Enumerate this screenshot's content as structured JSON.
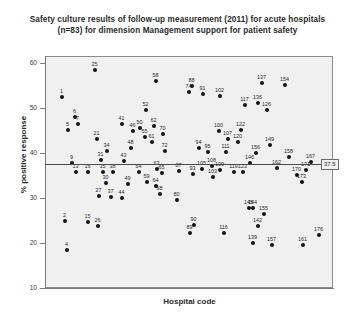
{
  "chart_title": {
    "line1": "Safety culture results of follow-up measurement (2011) for acute hospitals",
    "line2": "(n=83) for dimension Management support for patient safety"
  },
  "axes": {
    "y_label": "% positive response",
    "x_label": "Hospital code",
    "y_ticks": [
      "10",
      "20",
      "30",
      "40",
      "50",
      "60"
    ],
    "y_min": 10,
    "y_max": 62,
    "x_min": 0,
    "x_max": 185
  },
  "reference": {
    "value": 37.5,
    "label": "37.5"
  },
  "colors": {
    "plot_background": "#f0f0f0",
    "point": "#141414",
    "frame": "#8c8c8c",
    "reference_line": "#4a4a4a",
    "text": "#2a2a2a"
  },
  "chart_data": {
    "type": "scatter",
    "title": "Safety culture results of follow-up measurement (2011) for acute hospitals (n=83) for dimension Management support for patient safety",
    "xlabel": "Hospital code",
    "ylabel": "% positive response",
    "ylim": [
      10,
      62
    ],
    "xlim": [
      0,
      185
    ],
    "grid": false,
    "legend": null,
    "annotations": [
      {
        "text": "37.5",
        "type": "reference-line-value",
        "y": 37.5
      }
    ],
    "point_label_field": "Hospital code",
    "points": [
      {
        "label": "1",
        "px": 62,
        "py": 97,
        "y": 51.9
      },
      {
        "label": "2",
        "px": 65,
        "py": 221,
        "y": 20.0
      },
      {
        "label": "4",
        "px": 67,
        "py": 250,
        "y": 18.2
      },
      {
        "label": "5",
        "px": 68,
        "py": 130,
        "y": 47.4
      },
      {
        "label": "6",
        "px": 75,
        "py": 117,
        "y": 48.7
      },
      {
        "label": "7",
        "px": 78,
        "py": 124,
        "y": 47.9
      },
      {
        "label": "9",
        "px": 72,
        "py": 163,
        "y": 37.5
      },
      {
        "label": "13",
        "px": 76,
        "py": 172,
        "y": 36.0
      },
      {
        "label": "15",
        "px": 88,
        "py": 222,
        "y": 19.9
      },
      {
        "label": "16",
        "px": 88,
        "py": 172,
        "y": 36.0
      },
      {
        "label": "25",
        "px": 95,
        "py": 70,
        "y": 58.0
      },
      {
        "label": "26",
        "px": 98,
        "py": 226,
        "y": 19.5
      },
      {
        "label": "21",
        "px": 97,
        "py": 139,
        "y": 44.8
      },
      {
        "label": "27",
        "px": 99,
        "py": 196,
        "y": 25.5
      },
      {
        "label": "30",
        "px": 106,
        "py": 183,
        "y": 29.0
      },
      {
        "label": "31",
        "px": 101,
        "py": 160,
        "y": 38.5
      },
      {
        "label": "34",
        "px": 107,
        "py": 151,
        "y": 41.0
      },
      {
        "label": "35",
        "px": 103,
        "py": 172,
        "y": 36.0
      },
      {
        "label": "37",
        "px": 111,
        "py": 197,
        "y": 25.2
      },
      {
        "label": "38",
        "px": 113,
        "py": 172,
        "y": 36.0
      },
      {
        "label": "41",
        "px": 122,
        "py": 124,
        "y": 47.9
      },
      {
        "label": "43",
        "px": 124,
        "py": 161,
        "y": 38.2
      },
      {
        "label": "44",
        "px": 122,
        "py": 198,
        "y": 25.0
      },
      {
        "label": "46",
        "px": 133,
        "py": 131,
        "y": 47.2
      },
      {
        "label": "48",
        "px": 131,
        "py": 148,
        "y": 41.8
      },
      {
        "label": "49",
        "px": 128,
        "py": 184,
        "y": 28.7
      },
      {
        "label": "50",
        "px": 140,
        "py": 128,
        "y": 48.0
      },
      {
        "label": "52",
        "px": 146,
        "py": 110,
        "y": 50.5
      },
      {
        "label": "54",
        "px": 139,
        "py": 172,
        "y": 36.0
      },
      {
        "label": "55",
        "px": 145,
        "py": 137,
        "y": 45.2
      },
      {
        "label": "58",
        "px": 156,
        "py": 81,
        "y": 55.8
      },
      {
        "label": "59",
        "px": 147,
        "py": 182,
        "y": 29.2
      },
      {
        "label": "61",
        "px": 152,
        "py": 142,
        "y": 43.8
      },
      {
        "label": "62",
        "px": 154,
        "py": 126,
        "y": 48.3
      },
      {
        "label": "63",
        "px": 157,
        "py": 169,
        "y": 36.8
      },
      {
        "label": "64",
        "px": 156,
        "py": 186,
        "y": 28.3
      },
      {
        "label": "65",
        "px": 162,
        "py": 173,
        "y": 35.8
      },
      {
        "label": "68",
        "px": 160,
        "py": 194,
        "y": 26.0
      },
      {
        "label": "70",
        "px": 163,
        "py": 134,
        "y": 46.0
      },
      {
        "label": "72",
        "px": 165,
        "py": 151,
        "y": 41.0
      },
      {
        "label": "74",
        "px": 189,
        "py": 92,
        "y": 52.7
      },
      {
        "label": "80",
        "px": 177,
        "py": 200,
        "y": 24.5
      },
      {
        "label": "87",
        "px": 179,
        "py": 171,
        "y": 36.2
      },
      {
        "label": "88",
        "px": 192,
        "py": 86,
        "y": 54.2
      },
      {
        "label": "89",
        "px": 190,
        "py": 233,
        "y": 18.2
      },
      {
        "label": "90",
        "px": 194,
        "py": 225,
        "y": 19.2
      },
      {
        "label": "91",
        "px": 203,
        "py": 94,
        "y": 52.5
      },
      {
        "label": "93",
        "px": 193,
        "py": 174,
        "y": 35.5
      },
      {
        "label": "94",
        "px": 199,
        "py": 148,
        "y": 42.0
      },
      {
        "label": "95",
        "px": 208,
        "py": 152,
        "y": 40.8
      },
      {
        "label": "100",
        "px": 219,
        "py": 131,
        "y": 47.2
      },
      {
        "label": "102",
        "px": 220,
        "py": 96,
        "y": 52.0
      },
      {
        "label": "103",
        "px": 213,
        "py": 177,
        "y": 34.8
      },
      {
        "label": "105",
        "px": 202,
        "py": 169,
        "y": 36.8
      },
      {
        "label": "107",
        "px": 228,
        "py": 139,
        "y": 44.8
      },
      {
        "label": "108",
        "px": 212,
        "py": 166,
        "y": 37.5
      },
      {
        "label": "109",
        "px": 220,
        "py": 170,
        "y": 36.5
      },
      {
        "label": "111",
        "px": 226,
        "py": 152,
        "y": 40.8
      },
      {
        "label": "116",
        "px": 224,
        "py": 233,
        "y": 18.2
      },
      {
        "label": "117",
        "px": 245,
        "py": 105,
        "y": 50.0
      },
      {
        "label": "119",
        "px": 234,
        "py": 172,
        "y": 36.0
      },
      {
        "label": "120",
        "px": 238,
        "py": 142,
        "y": 43.8
      },
      {
        "label": "122",
        "px": 241,
        "py": 130,
        "y": 47.3
      },
      {
        "label": "123",
        "px": 243,
        "py": 172,
        "y": 36.0
      },
      {
        "label": "126",
        "px": 267,
        "py": 110,
        "y": 50.5
      },
      {
        "label": "136",
        "px": 258,
        "py": 103,
        "y": 51.0
      },
      {
        "label": "137",
        "px": 262,
        "py": 83,
        "y": 55.5
      },
      {
        "label": "139",
        "px": 253,
        "py": 243,
        "y": 16.8
      },
      {
        "label": "142",
        "px": 258,
        "py": 226,
        "y": 19.2
      },
      {
        "label": "144",
        "px": 253,
        "py": 208,
        "y": 22.5
      },
      {
        "label": "145",
        "px": 249,
        "py": 208,
        "y": 22.5
      },
      {
        "label": "146",
        "px": 250,
        "py": 163,
        "y": 37.5
      },
      {
        "label": "149",
        "px": 270,
        "py": 145,
        "y": 43.0
      },
      {
        "label": "154",
        "px": 285,
        "py": 85,
        "y": 55.2
      },
      {
        "label": "155",
        "px": 264,
        "py": 214,
        "y": 21.5
      },
      {
        "label": "156",
        "px": 256,
        "py": 153,
        "y": 40.5
      },
      {
        "label": "157",
        "px": 272,
        "py": 245,
        "y": 16.5
      },
      {
        "label": "158",
        "px": 289,
        "py": 157,
        "y": 39.5
      },
      {
        "label": "161",
        "px": 303,
        "py": 245,
        "y": 16.5
      },
      {
        "label": "162",
        "px": 277,
        "py": 168,
        "y": 37.0
      },
      {
        "label": "167",
        "px": 311,
        "py": 162,
        "y": 37.8
      },
      {
        "label": "170",
        "px": 297,
        "py": 175,
        "y": 35.2
      },
      {
        "label": "171",
        "px": 306,
        "py": 170,
        "y": 36.5
      },
      {
        "label": "173",
        "px": 302,
        "py": 182,
        "y": 29.5
      },
      {
        "label": "176",
        "px": 319,
        "py": 235,
        "y": 18.0
      }
    ]
  }
}
